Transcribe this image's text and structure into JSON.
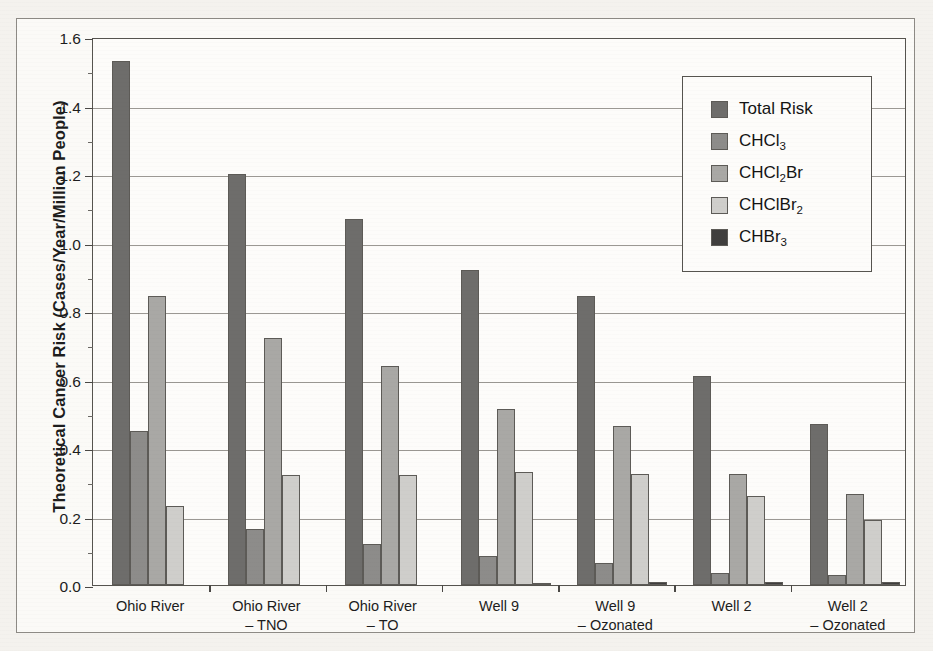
{
  "figure": {
    "y_axis_title": "Theoretical Cancer Risk (Cases/Year/Million People)"
  },
  "legend": {
    "items": [
      {
        "label": "Total Risk",
        "base": "Total Risk",
        "sub": "",
        "tail": "",
        "color": "#6e6d6b",
        "icon": "legend-swatch-icon"
      },
      {
        "label": "CHCl3",
        "base": "CHCl",
        "sub": "3",
        "tail": "",
        "color": "#8d8c8a",
        "icon": "legend-swatch-icon"
      },
      {
        "label": "CHCl2Br",
        "base": "CHCl",
        "sub": "2",
        "tail": "Br",
        "color": "#a9a8a5",
        "icon": "legend-swatch-icon"
      },
      {
        "label": "CHClBr2",
        "base": "CHClBr",
        "sub": "2",
        "tail": "",
        "color": "#cfcecb",
        "icon": "legend-swatch-icon"
      },
      {
        "label": "CHBr3",
        "base": "CHBr",
        "sub": "3",
        "tail": "",
        "color": "#403f3e",
        "icon": "legend-swatch-icon"
      }
    ]
  },
  "y_axis": {
    "ticks": [
      "0.0",
      "0.2",
      "0.4",
      "0.6",
      "0.8",
      "1.0",
      "1.2",
      "1.4",
      "1.6"
    ],
    "min": 0.0,
    "max": 1.6,
    "step": 0.2,
    "minor_step": 0.1
  },
  "x_axis": {
    "labels": [
      {
        "line1": "Ohio River",
        "line2": ""
      },
      {
        "line1": "Ohio River",
        "line2": "– TNO"
      },
      {
        "line1": "Ohio River",
        "line2": "– TO"
      },
      {
        "line1": "Well 9",
        "line2": ""
      },
      {
        "line1": "Well 9",
        "line2": "– Ozonated"
      },
      {
        "line1": "Well 2",
        "line2": ""
      },
      {
        "line1": "Well 2",
        "line2": "– Ozonated"
      }
    ]
  },
  "chart_data": {
    "type": "bar",
    "title": "",
    "xlabel": "",
    "ylabel": "Theoretical Cancer Risk (Cases/Year/Million People)",
    "ylim": [
      0.0,
      1.6
    ],
    "grid": true,
    "legend_position": "top-right-inside",
    "categories": [
      "Ohio River",
      "Ohio River – TNO",
      "Ohio River – TO",
      "Well 9",
      "Well 9 – Ozonated",
      "Well 2",
      "Well 2 – Ozonated"
    ],
    "series": [
      {
        "name": "Total Risk",
        "color": "#6e6d6b",
        "values": [
          1.53,
          1.2,
          1.07,
          0.92,
          0.845,
          0.61,
          0.47
        ]
      },
      {
        "name": "CHCl3",
        "color": "#8d8c8a",
        "values": [
          0.45,
          0.165,
          0.12,
          0.085,
          0.065,
          0.035,
          0.03
        ]
      },
      {
        "name": "CHCl2Br",
        "color": "#a9a8a5",
        "values": [
          0.845,
          0.72,
          0.64,
          0.515,
          0.465,
          0.325,
          0.265
        ]
      },
      {
        "name": "CHClBr2",
        "color": "#cfcecb",
        "values": [
          0.23,
          0.32,
          0.32,
          0.33,
          0.325,
          0.26,
          0.19
        ]
      },
      {
        "name": "CHBr3",
        "color": "#403f3e",
        "values": [
          0.0,
          0.0,
          0.0,
          0.005,
          0.008,
          0.01,
          0.01
        ]
      }
    ]
  }
}
